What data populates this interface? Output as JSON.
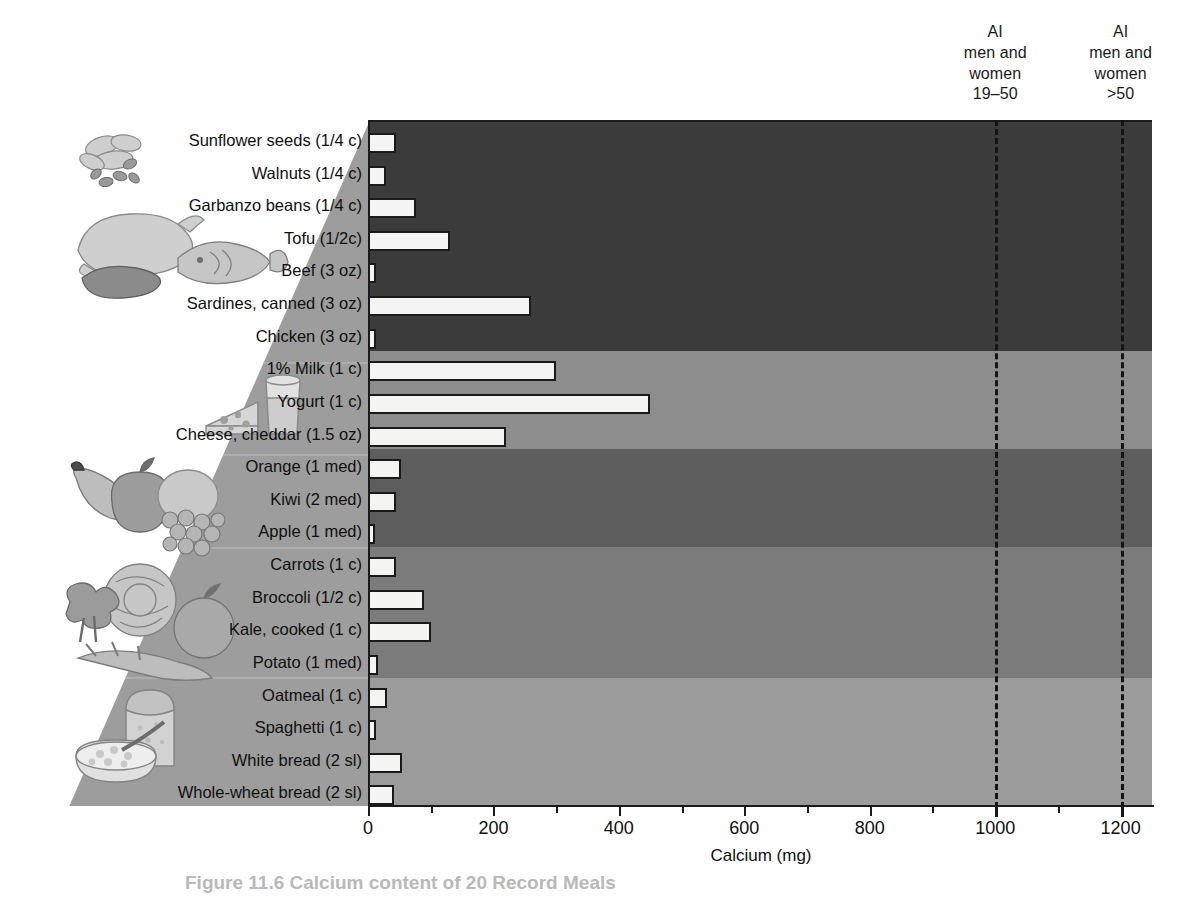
{
  "figure": {
    "caption": "Figure 11.6  Calcium content of 20 Record Meals"
  },
  "annotations": {
    "ref_1": "AI\nmen and\nwomen\n19–50",
    "ref_2": "AI\nmen and\nwomen\n>50",
    "ref_1_value": 1000,
    "ref_2_value": 1200
  },
  "colors": {
    "band_protein": "#3b3b3b",
    "band_dairy": "#8d8d8d",
    "band_fruit": "#5d5d5d",
    "band_vegetable": "#7b7b7b",
    "band_grain": "#9b9b9b",
    "bar_fill": "#f4f4f2",
    "bar_stroke": "#1a1a1a",
    "wedge": "#9d9d9d"
  },
  "chart_data": {
    "type": "bar",
    "orientation": "horizontal",
    "title": "",
    "xlabel": "Calcium (mg)",
    "ylabel": "",
    "xlim": [
      0,
      1250
    ],
    "xticks": [
      0,
      200,
      400,
      600,
      800,
      1000,
      1200
    ],
    "xtick_labels": [
      "0",
      "200",
      "400",
      "600",
      "800",
      "1000",
      "1200"
    ],
    "minor_xticks": [
      100,
      300,
      500,
      700,
      900,
      1100
    ],
    "grid": false,
    "legend": "none",
    "categories": [
      "Sunflower seeds (1/4 c)",
      "Walnuts (1/4 c)",
      "Garbanzo beans (1/4 c)",
      "Tofu (1/2c)",
      "Beef (3 oz)",
      "Sardines, canned (3 oz)",
      "Chicken (3 oz)",
      "1% Milk (1 c)",
      "Yogurt (1 c)",
      "Cheese, cheddar (1.5 oz)",
      "Orange (1 med)",
      "Kiwi (2 med)",
      "Apple (1 med)",
      "Carrots (1 c)",
      "Broccoli (1/2 c)",
      "Kale, cooked (1 c)",
      "Potato (1 med)",
      "Oatmeal (1 c)",
      "Spaghetti (1 c)",
      "White bread (2 sl)",
      "Whole-wheat bread (2 sl)"
    ],
    "values": [
      45,
      28,
      76,
      130,
      12,
      260,
      13,
      300,
      450,
      220,
      52,
      45,
      10,
      45,
      90,
      100,
      16,
      30,
      12,
      55,
      42
    ],
    "groups": [
      {
        "name": "Protein foods",
        "color": "#3b3b3b",
        "count": 7
      },
      {
        "name": "Dairy",
        "color": "#8d8d8d",
        "count": 3
      },
      {
        "name": "Fruits",
        "color": "#5d5d5d",
        "count": 3
      },
      {
        "name": "Vegetables",
        "color": "#7b7b7b",
        "count": 4
      },
      {
        "name": "Grains",
        "color": "#9b9b9b",
        "count": 4
      }
    ],
    "reference_lines": [
      {
        "label": "AI men and women 19–50",
        "value": 1000
      },
      {
        "label": "AI men and women >50",
        "value": 1200
      }
    ]
  },
  "illustrations": [
    {
      "name": "nuts-and-seeds-illustration",
      "group": "Protein foods"
    },
    {
      "name": "poultry-fish-meat-illustration",
      "group": "Protein foods"
    },
    {
      "name": "cheese-and-milk-illustration",
      "group": "Dairy"
    },
    {
      "name": "fruit-basket-illustration",
      "group": "Fruits"
    },
    {
      "name": "vegetables-illustration",
      "group": "Vegetables"
    },
    {
      "name": "bread-and-cereal-illustration",
      "group": "Grains"
    }
  ]
}
